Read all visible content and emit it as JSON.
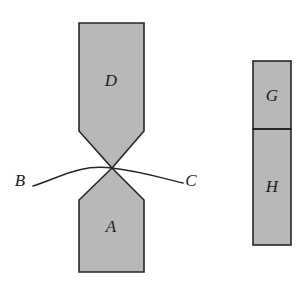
{
  "figure": {
    "background_color": "#ffffff",
    "fill_color": "#b8b8b8",
    "stroke_color": "#262626",
    "label_color": "#1d1d1d",
    "width": 308,
    "height": 284
  },
  "left_assembly": {
    "name": "necked-specimen",
    "upper_piece": {
      "label": "D",
      "label_x": 111,
      "label_y": 82
    },
    "lower_piece": {
      "label": "A",
      "label_x": 111,
      "label_y": 228
    },
    "neck_point": {
      "x": 112,
      "y": 168
    },
    "body_left_x": 79,
    "body_right_x": 144,
    "top_y": 23,
    "bottom_y": 272,
    "upper_taper_start_y": 131,
    "lower_taper_end_y": 200
  },
  "curves": {
    "left_curve": {
      "label": "B",
      "label_x": 20,
      "label_y": 182,
      "start_x": 33,
      "start_y": 186,
      "end_x": 112,
      "end_y": 168
    },
    "right_curve": {
      "label": "C",
      "label_x": 191,
      "label_y": 182,
      "start_x": 112,
      "start_y": 168,
      "end_x": 183,
      "end_y": 183
    }
  },
  "right_assembly": {
    "name": "fragment-bar",
    "left_x": 253,
    "right_x": 291,
    "top_y": 61,
    "bottom_y": 245,
    "divider_y": 129,
    "upper_piece": {
      "label": "G",
      "label_x": 272,
      "label_y": 97
    },
    "lower_piece": {
      "label": "H",
      "label_x": 272,
      "label_y": 188
    }
  }
}
